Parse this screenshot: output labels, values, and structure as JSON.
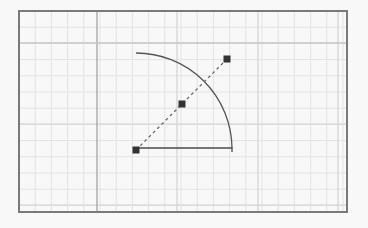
{
  "canvas": {
    "width": 368,
    "height": 228,
    "background": "#f8f8f8",
    "frame": {
      "x": 19,
      "y": 11,
      "width": 328,
      "height": 201,
      "stroke": "#7a7a7a",
      "stroke_width": 2
    }
  },
  "grid": {
    "minor_spacing": 16.2,
    "minor_color": "#e3e3e3",
    "major_color": "#a9a9a9",
    "major_vertical_x": [
      97
    ],
    "secondary_vertical_x": [
      177,
      258,
      338
    ],
    "major_horizontal_y": [
      43
    ],
    "secondary_horizontal_y": [
      124,
      205
    ]
  },
  "shapes": {
    "arc": {
      "center": [
        136,
        148
      ],
      "radius": 96,
      "start": [
        136,
        53
      ],
      "end": [
        232,
        148
      ],
      "stroke": "#555555",
      "stroke_width": 1.3
    },
    "radius_line": {
      "from": [
        136,
        148
      ],
      "to": [
        232,
        148
      ],
      "end_tick_to": [
        232,
        152
      ],
      "stroke": "#4a4a4a",
      "stroke_width": 1.3
    },
    "dashed_line": {
      "from": [
        136,
        150
      ],
      "to": [
        227,
        59
      ],
      "stroke": "#6a6a6a",
      "dash": "3,3"
    },
    "handles": [
      {
        "name": "start-handle",
        "x": 136,
        "y": 150,
        "size": 7,
        "fill": "#333333"
      },
      {
        "name": "mid-handle",
        "x": 182,
        "y": 104,
        "size": 7,
        "fill": "#333333"
      },
      {
        "name": "end-handle",
        "x": 227,
        "y": 59,
        "size": 7,
        "fill": "#333333"
      }
    ]
  }
}
